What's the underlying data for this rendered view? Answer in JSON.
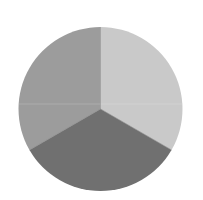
{
  "chart_data": {
    "type": "pie",
    "title": "",
    "labels": [
      "",
      "",
      ""
    ],
    "values": [
      33.33,
      33.33,
      33.33
    ],
    "slices": [
      {
        "name": "upper-left",
        "value": 33.33,
        "color": "#9c9c9c",
        "start_deg": 240,
        "end_deg": 360
      },
      {
        "name": "upper-right",
        "value": 33.33,
        "color": "#c9c9c9",
        "start_deg": 0,
        "end_deg": 120
      },
      {
        "name": "bottom",
        "value": 33.33,
        "color": "#707070",
        "start_deg": 120,
        "end_deg": 240
      }
    ],
    "legend": "none",
    "grid": false,
    "geometry": {
      "cx": 100.5,
      "cy": 109,
      "r": 82
    }
  },
  "colors": {
    "background": "#ffffff",
    "divider": "#8a8a8a"
  }
}
